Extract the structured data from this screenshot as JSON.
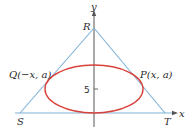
{
  "diagram": {
    "type": "geometry-figure",
    "colors": {
      "triangle": "#7fb2d6",
      "ellipse": "#d9423a",
      "axes": "#555555",
      "text": "#2a2a2a"
    },
    "axes": {
      "x_label": "x",
      "y_label": "y",
      "tick_label": "5"
    },
    "vertices": {
      "R": "R",
      "S": "S",
      "T": "T"
    },
    "points": {
      "P": "P(x, a)",
      "Q": "Q(−x, a)"
    }
  }
}
